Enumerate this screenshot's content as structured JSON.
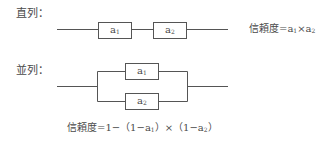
{
  "series": {
    "heading": "直列：",
    "components": [
      {
        "name": "a",
        "sub": "1"
      },
      {
        "name": "a",
        "sub": "2"
      }
    ],
    "formula": {
      "prefix": "信頼度=",
      "t1": "a",
      "s1": "1",
      "op": "×",
      "t2": "a",
      "s2": "2"
    }
  },
  "parallel": {
    "heading": "並列：",
    "components": [
      {
        "name": "a",
        "sub": "1"
      },
      {
        "name": "a",
        "sub": "2"
      }
    ],
    "formula": {
      "prefix": "信頼度=1−（1−",
      "t1": "a",
      "s1": "1",
      "mid": "）×（1−",
      "t2": "a",
      "s2": "2",
      "suffix": "）"
    }
  },
  "colors": {
    "line": "#555555",
    "text": "#4a4a4a"
  }
}
